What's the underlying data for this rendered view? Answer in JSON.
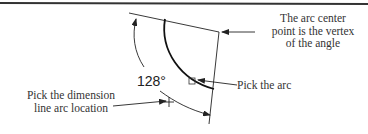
{
  "figure": {
    "dimension_value": "128°",
    "callouts": {
      "vertex": [
        "The arc center",
        "point is the vertex",
        "of the angle"
      ],
      "arc": "Pick the arc",
      "dimension_location": [
        "Pick the dimension",
        "line arc location"
      ]
    },
    "colors": {
      "line": "#222222",
      "text": "#333333",
      "rule": "#333333"
    }
  }
}
